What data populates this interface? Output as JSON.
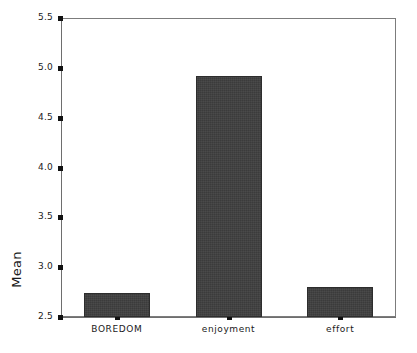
{
  "chart_data": {
    "type": "bar",
    "title": "",
    "xlabel": "",
    "ylabel": "Mean",
    "categories": [
      "BOREDOM",
      "enjoyment",
      "effort"
    ],
    "values": [
      2.74,
      4.92,
      2.8
    ],
    "ylim": [
      2.5,
      5.5
    ],
    "ytick_labels": [
      "2.5",
      "3.0",
      "3.5",
      "4.0",
      "4.5",
      "5.0",
      "5.5"
    ],
    "ytick_values": [
      2.5,
      3.0,
      3.5,
      4.0,
      4.5,
      5.0,
      5.5
    ],
    "grid": false,
    "legend": false,
    "bar_color": "#3b3b3b",
    "axis_color": "#6e6e6e",
    "background_color": "#ffffff"
  }
}
